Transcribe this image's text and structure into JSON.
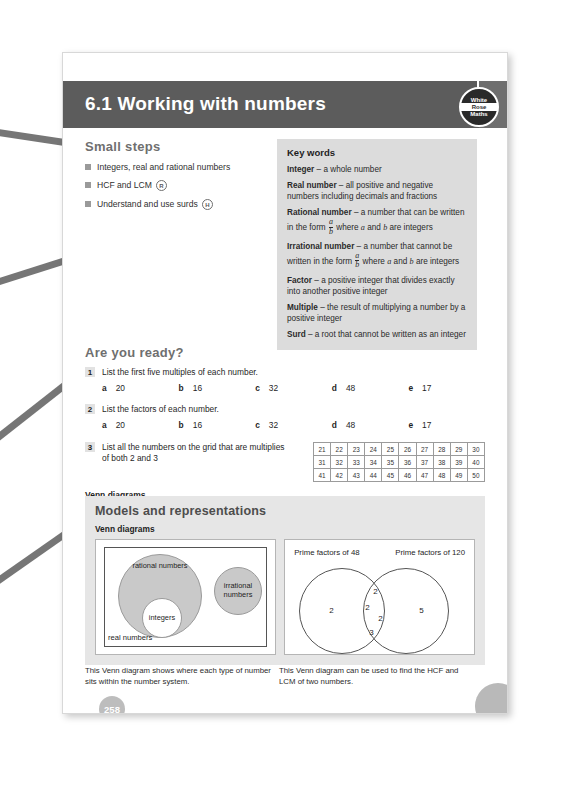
{
  "header": {
    "chapter_title": "6.1 Working with numbers",
    "logo": {
      "line1": "White",
      "line2": "Rose",
      "line3": "Maths"
    }
  },
  "small_steps": {
    "heading": "Small steps",
    "items": [
      {
        "text": "Integers, real and rational numbers",
        "badge": ""
      },
      {
        "text": "HCF and LCM",
        "badge": "R"
      },
      {
        "text": "Understand and use surds",
        "badge": "H"
      }
    ]
  },
  "key_words": {
    "heading": "Key words",
    "entries": [
      {
        "term": "Integer",
        "definition": " – a whole number"
      },
      {
        "term": "Real number",
        "definition": " – all positive and negative numbers including decimals and fractions"
      },
      {
        "term": "Rational number",
        "definition": " – a number that can be written in the form a/b where a and b are integers"
      },
      {
        "term": "Irrational number",
        "definition": " – a number that cannot be written in the form a/b where a and b are integers"
      },
      {
        "term": "Factor",
        "definition": " – a positive integer that divides exactly into another positive integer"
      },
      {
        "term": "Multiple",
        "definition": " – the result of multiplying a number by a positive integer"
      },
      {
        "term": "Surd",
        "definition": " – a root that cannot be written as an integer"
      }
    ],
    "fraction": {
      "numerator": "a",
      "denominator": "b"
    }
  },
  "are_you_ready": {
    "heading": "Are you ready?",
    "questions": [
      {
        "number": "1",
        "text": "List the first five multiples of each number.",
        "parts": [
          {
            "label": "a",
            "value": "20"
          },
          {
            "label": "b",
            "value": "16"
          },
          {
            "label": "c",
            "value": "32"
          },
          {
            "label": "d",
            "value": "48"
          },
          {
            "label": "e",
            "value": "17"
          }
        ]
      },
      {
        "number": "2",
        "text": "List the factors of each number.",
        "parts": [
          {
            "label": "a",
            "value": "20"
          },
          {
            "label": "b",
            "value": "16"
          },
          {
            "label": "c",
            "value": "32"
          },
          {
            "label": "d",
            "value": "48"
          },
          {
            "label": "e",
            "value": "17"
          }
        ]
      },
      {
        "number": "3",
        "text": "List all the numbers on the grid that are multiplies of both 2 and 3",
        "parts": []
      }
    ],
    "venn_label": "Venn diagrams",
    "number_grid": [
      [
        "21",
        "22",
        "23",
        "24",
        "25",
        "26",
        "27",
        "28",
        "29",
        "30"
      ],
      [
        "31",
        "32",
        "33",
        "34",
        "35",
        "36",
        "37",
        "38",
        "39",
        "40"
      ],
      [
        "41",
        "42",
        "43",
        "44",
        "45",
        "46",
        "47",
        "48",
        "49",
        "50"
      ]
    ]
  },
  "models": {
    "heading": "Models and representations",
    "subheading": "Venn diagrams",
    "venn_left": {
      "rational_label": "rational numbers",
      "integers_label": "integers",
      "irrational_label": "irrational numbers",
      "universe_label": "real numbers"
    },
    "venn_right": {
      "left_title": "Prime factors of 48",
      "right_title": "Prime factors of 120",
      "left_only": [
        "2"
      ],
      "intersection": [
        "2",
        "2",
        "2",
        "3"
      ],
      "right_only": [
        "5"
      ]
    },
    "captions": {
      "left": "This Venn diagram shows where each type of number sits within the number system.",
      "right": "This Venn diagram can be used to find the HCF and LCM of two numbers."
    }
  },
  "page_number": "258",
  "colors": {
    "header_band": "#5c5c5c",
    "key_words_bg": "#dcdcdc",
    "models_bg": "#e6e6e6",
    "heading_grey": "#6f6f6f",
    "venn_fill": "#c9c9c9",
    "arrow": "#767676"
  }
}
